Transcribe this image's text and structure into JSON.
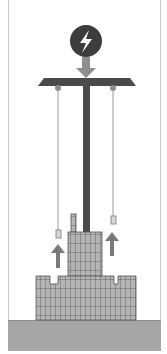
{
  "diagram": {
    "colors": {
      "background": "#ffffff",
      "frame": "#c8c8c8",
      "ground": "#a6a6a6",
      "platform": "#4a4a4a",
      "pillar": "#4a4a4a",
      "energy_circle": "#3d3d3d",
      "energy_bolt": "#ffffff",
      "down_arrow": "#8f8f8f",
      "up_arrow": "#7a7a7a",
      "cable": "#9a9a9a",
      "counterweight_fill": "#d8d8d8",
      "counterweight_stroke": "#7a7a7a",
      "block_fill": "#b4b4b4",
      "block_line": "#555555"
    },
    "icons": {
      "energy": "lightning-bolt-icon",
      "down_arrow": "arrow-down-icon",
      "up_arrow": "arrow-up-icon"
    },
    "labels": []
  }
}
